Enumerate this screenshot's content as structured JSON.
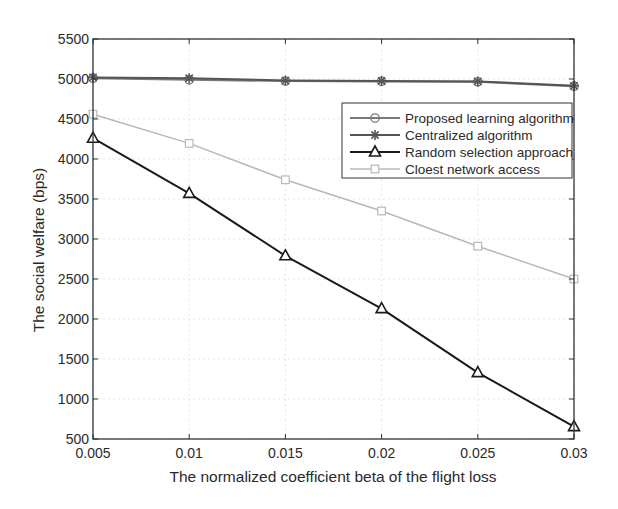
{
  "chart_data": {
    "type": "line",
    "title": "",
    "xlabel": "The normalized coefficient beta of the flight loss",
    "ylabel": "The social welfare (bps)",
    "x": [
      0.005,
      0.01,
      0.015,
      0.02,
      0.025,
      0.03
    ],
    "x_tick_labels": [
      "0.005",
      "0.01",
      "0.015",
      "0.02",
      "0.025",
      "0.03"
    ],
    "xlim": [
      0.005,
      0.03
    ],
    "ylim": [
      500,
      5500
    ],
    "y_ticks": [
      500,
      1000,
      1500,
      2000,
      2500,
      3000,
      3500,
      4000,
      4500,
      5000,
      5500
    ],
    "y_tick_labels": [
      "500",
      "1000",
      "1500",
      "2000",
      "2500",
      "3000",
      "3500",
      "4000",
      "4500",
      "5000",
      "5500"
    ],
    "grid": true,
    "legend_position": "upper right",
    "series": [
      {
        "name": "Proposed learning algorithm",
        "marker": "circle",
        "color": "#7a7a7a",
        "line_width": 2,
        "values": [
          5010,
          4990,
          4975,
          4970,
          4965,
          4910
        ]
      },
      {
        "name": "Centralized algorithm",
        "marker": "star",
        "color": "#555555",
        "line_width": 2,
        "values": [
          5020,
          5010,
          4980,
          4975,
          4970,
          4915
        ]
      },
      {
        "name": "Random selection approach",
        "marker": "triangle",
        "color": "#1a1a1a",
        "line_width": 2,
        "values": [
          4260,
          3570,
          2790,
          2130,
          1330,
          655
        ]
      },
      {
        "name": "Cloest network access",
        "marker": "square",
        "color": "#b8b8b8",
        "line_width": 1.5,
        "values": [
          4560,
          4195,
          3740,
          3350,
          2910,
          2500
        ]
      }
    ]
  }
}
